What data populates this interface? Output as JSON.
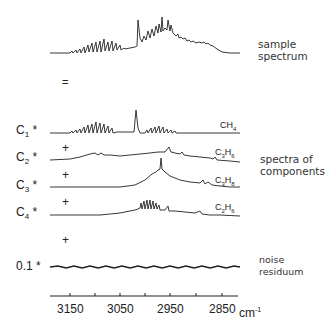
{
  "sample": {
    "label_line1": "sample",
    "label_line2": "spectrum"
  },
  "equals": "=",
  "components": [
    {
      "coef_base": "C",
      "coef_sub": "1",
      "star": "*",
      "formula": [
        "CH",
        "4",
        "",
        ""
      ]
    },
    {
      "coef_base": "C",
      "coef_sub": "2",
      "star": "*",
      "plus": "+",
      "formula": [
        "C",
        "3",
        "H",
        "6"
      ]
    },
    {
      "coef_base": "C",
      "coef_sub": "3",
      "star": "*",
      "plus": "+",
      "formula": [
        "C",
        "3",
        "H",
        "8"
      ]
    },
    {
      "coef_base": "C",
      "coef_sub": "4",
      "star": "*",
      "plus": "+",
      "formula": [
        "C",
        "2",
        "H",
        "6"
      ]
    }
  ],
  "components_label": {
    "line1": "spectra of",
    "line2": "components"
  },
  "noise": {
    "plus": "+",
    "coef": "0.1",
    "star": "*",
    "label_line1": "noise",
    "label_line2": "residuum"
  },
  "axis": {
    "ticks": [
      "3150",
      "3050",
      "2950",
      "2850"
    ],
    "unit": "cm",
    "unit_exp": "-1"
  }
}
